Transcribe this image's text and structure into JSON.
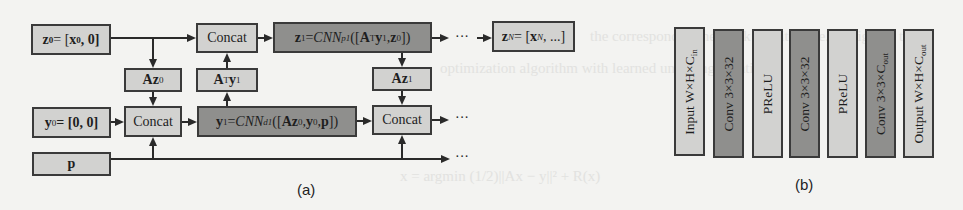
{
  "panel_a": {
    "caption": "(a)",
    "z0": {
      "lhs": "z",
      "lhs_sub": "0",
      "eq": " = [",
      "x": "x",
      "x_sub": "0",
      "rest": ", 0]"
    },
    "y0": {
      "lhs": "y",
      "lhs_sub": "0",
      "rest": " = [0, 0]"
    },
    "p": {
      "label": "p"
    },
    "concat_top": {
      "label": "Concat"
    },
    "concat_bottom": {
      "label": "Concat"
    },
    "concat_right": {
      "label": "Concat"
    },
    "az0": {
      "a": "Az",
      "sub": "0"
    },
    "aty1": {
      "a": "A",
      "sup": "T",
      "y": "y",
      "sub": "1"
    },
    "az1": {
      "a": "Az",
      "sub": "1"
    },
    "z1": {
      "lhs": "z",
      "lhs_sub": "1",
      "eq": " = ",
      "fn": "CNN",
      "fn_sub": "p1",
      "open": "([",
      "a": "A",
      "sup": "T",
      "y": "y",
      "y_sub": "1",
      "comma": ", ",
      "z": "z",
      "z_sub": "0",
      "close": "])"
    },
    "y1": {
      "lhs": "y",
      "lhs_sub": "1",
      "eq": " = ",
      "fn": "CNN",
      "fn_sub": "d1",
      "open": "([",
      "az": "Az",
      "az_sub": "0",
      "comma1": ", ",
      "y": "y",
      "y_sub": "0",
      "comma2": ", ",
      "p": "p",
      "close": "])"
    },
    "zN": {
      "lhs": "z",
      "lhs_sub": "N",
      "eq": " = [",
      "x": "x",
      "x_sub": "N",
      "rest": ", ...]"
    },
    "ellipsis_top": "···",
    "ellipsis_mid": "···",
    "ellipsis_bottom": "···"
  },
  "panel_b": {
    "caption": "(b)",
    "layers": [
      {
        "label": "Input  W×H×C",
        "sub": "in",
        "shade": "light"
      },
      {
        "label": "Conv 3×3×32",
        "sub": "",
        "shade": "dark"
      },
      {
        "label": "PReLU",
        "sub": "",
        "shade": "light"
      },
      {
        "label": "Conv 3×3×32",
        "sub": "",
        "shade": "dark"
      },
      {
        "label": "PReLU",
        "sub": "",
        "shade": "light"
      },
      {
        "label": "Conv 3×3×C",
        "sub": "out",
        "shade": "dark"
      },
      {
        "label": "Output W×H×C",
        "sub": "out",
        "shade": "light"
      }
    ]
  },
  "colors": {
    "background": "#f3f3f1",
    "light_box": "#d2d2d0",
    "dark_box": "#8f8f8d",
    "border": "#3a3a3a"
  }
}
